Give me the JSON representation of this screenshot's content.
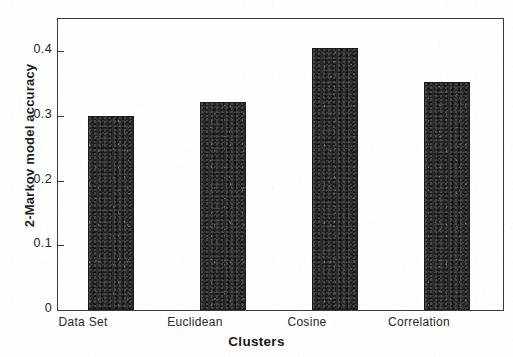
{
  "chart_data": {
    "type": "bar",
    "title": "",
    "subtitle": "",
    "xlabel": "Clusters",
    "ylabel": "2-Markov model accuracy",
    "categories": [
      "Data Set",
      "Euclidean",
      "Cosine",
      "Correlation"
    ],
    "values": [
      0.3,
      0.322,
      0.405,
      0.352
    ],
    "series": [
      {
        "name": "2-Markov model accuracy",
        "values": [
          0.3,
          0.322,
          0.405,
          0.352
        ]
      }
    ],
    "ylim": [
      0,
      0.45
    ],
    "xlim": [
      0,
      4
    ],
    "y_ticks": [
      0,
      0.1,
      0.2,
      0.3,
      0.4
    ],
    "y_tick_labels": [
      "0",
      "0.1",
      "0.2",
      "0.3",
      "0.4"
    ],
    "grid": false,
    "legend": false,
    "legend_position": "none",
    "bar_color": "#2b2b2b",
    "axis_color": "#3b3b3b",
    "background_color": "#fefefe",
    "annotations": []
  },
  "axes": {
    "y_title": "2-Markov model accuracy",
    "x_title": "Clusters"
  }
}
